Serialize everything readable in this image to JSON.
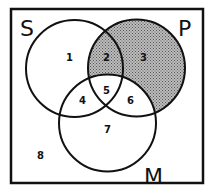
{
  "diagram": {
    "type": "venn",
    "sets": [
      {
        "id": "S",
        "label": "S"
      },
      {
        "id": "P",
        "label": "P"
      },
      {
        "id": "M",
        "label": "M"
      }
    ],
    "regions": [
      {
        "id": 1,
        "label": "1",
        "shaded": false
      },
      {
        "id": 2,
        "label": "2",
        "shaded": true
      },
      {
        "id": 3,
        "label": "3",
        "shaded": true
      },
      {
        "id": 4,
        "label": "4",
        "shaded": false
      },
      {
        "id": 5,
        "label": "5",
        "shaded": false
      },
      {
        "id": 6,
        "label": "6",
        "shaded": false
      },
      {
        "id": 7,
        "label": "7",
        "shaded": false
      },
      {
        "id": 8,
        "label": "8",
        "shaded": false
      }
    ],
    "colors": {
      "stroke": "#111111",
      "shade": "#9a9a9a",
      "background": "#ffffff"
    }
  }
}
